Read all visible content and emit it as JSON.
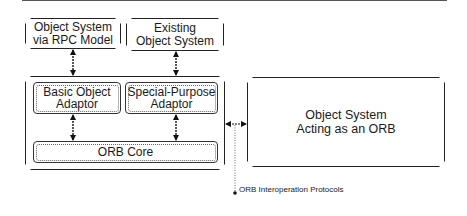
{
  "diagram": {
    "type": "architecture",
    "boxes": {
      "rpc_system": "Object System\nvia RPC Model",
      "existing_system": "Existing\nObject System",
      "basic_adaptor": "Basic Object\nAdaptor",
      "special_adaptor": "Special-Purpose\nAdaptor",
      "orb_core": "ORB Core",
      "orb_system": "Object System\nActing as an ORB"
    },
    "annotation": "ORB Interoperation Protocols",
    "connections": [
      {
        "from": "rpc_system",
        "to": "basic_adaptor",
        "style": "bidirectional"
      },
      {
        "from": "existing_system",
        "to": "special_adaptor",
        "style": "bidirectional"
      },
      {
        "from": "basic_adaptor",
        "to": "orb_core",
        "style": "bidirectional"
      },
      {
        "from": "special_adaptor",
        "to": "orb_core",
        "style": "bidirectional"
      },
      {
        "from": "orb_container",
        "to": "orb_system",
        "style": "bidirectional",
        "label": "ORB Interoperation Protocols"
      }
    ]
  }
}
